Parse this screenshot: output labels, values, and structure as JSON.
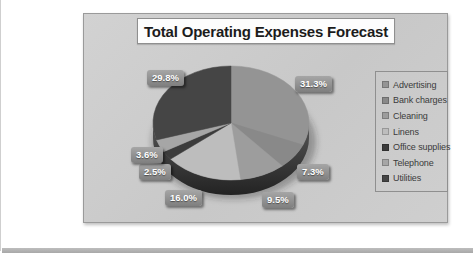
{
  "page": {
    "background_color": "#ffffff",
    "bottom_edge_color": "#aeaeae"
  },
  "chart": {
    "title": "Total Operating Expenses Forecast",
    "background_color": "#cccccc",
    "border_color": "#9a9a9a"
  },
  "chart_data": {
    "type": "pie",
    "title": "Total Operating Expenses Forecast",
    "effect": "3d",
    "grid": false,
    "legend_position": "right",
    "start_angle_deg": 0,
    "direction": "clockwise",
    "slices": [
      {
        "name": "Advertising",
        "value": 31.3,
        "label": "31.3%",
        "color": "#949494",
        "label_x": 211,
        "label_y": 62
      },
      {
        "name": "Bank charges",
        "value": 7.3,
        "label": "7.3%",
        "color": "#898989",
        "label_x": 213,
        "label_y": 150
      },
      {
        "name": "Cleaning",
        "value": 9.5,
        "label": "9.5%",
        "color": "#9d9d9d",
        "label_x": 178,
        "label_y": 178
      },
      {
        "name": "Linens",
        "value": 16.0,
        "label": "16.0%",
        "color": "#bdbdbd",
        "label_x": 81,
        "label_y": 176
      },
      {
        "name": "Office supplies",
        "value": 2.5,
        "label": "2.5%",
        "color": "#3c3c3c",
        "label_x": 55,
        "label_y": 150
      },
      {
        "name": "Telephone",
        "value": 3.6,
        "label": "3.6%",
        "color": "#a6a6a6",
        "label_x": 47,
        "label_y": 133
      },
      {
        "name": "Utilities",
        "value": 29.8,
        "label": "29.8%",
        "color": "#454545",
        "label_x": 63,
        "label_y": 56
      }
    ]
  }
}
